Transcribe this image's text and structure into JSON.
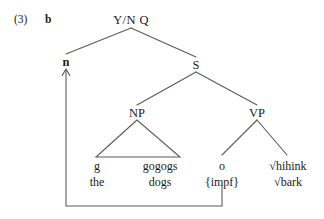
{
  "figure": {
    "example_number": "(3)",
    "example_letter": "b",
    "type": "syntax-tree"
  },
  "nodes": {
    "root": "Y/N Q",
    "trace": "n",
    "s": "S",
    "np": "NP",
    "vp": "VP"
  },
  "leaves": [
    {
      "form": "g",
      "gloss": "the"
    },
    {
      "form": "gogogs",
      "gloss": "dogs"
    },
    {
      "form": "o",
      "gloss": "{impf}"
    },
    {
      "form": "√hihink",
      "gloss": "√bark"
    }
  ],
  "movement": {
    "from_label": "{impf}",
    "to_label": "n",
    "arrow": "up-arrow"
  },
  "colors": {
    "ink": "#1a1a1a",
    "line": "#5a5a5a",
    "background": "#ffffff"
  }
}
